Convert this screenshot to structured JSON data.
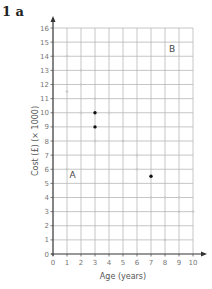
{
  "question_label": "1  a",
  "chart_data": {
    "type": "scatter",
    "title": "",
    "xlabel": "Age (years)",
    "ylabel": "Cost (£) (× 1000)",
    "xlim": [
      0,
      10
    ],
    "ylim": [
      0,
      16
    ],
    "x_ticks": [
      0,
      1,
      2,
      3,
      4,
      5,
      6,
      7,
      8,
      9,
      10
    ],
    "y_ticks": [
      0,
      1,
      2,
      3,
      4,
      5,
      6,
      7,
      8,
      9,
      10,
      11,
      12,
      13,
      14,
      15,
      16
    ],
    "grid": true,
    "series": [
      {
        "name": "faint points",
        "color": "#c8c8c8",
        "points": [
          [
            1,
            14
          ],
          [
            2,
            13
          ],
          [
            2,
            12
          ],
          [
            1,
            11.5
          ],
          [
            3,
            11
          ],
          [
            2,
            10
          ],
          [
            4,
            10
          ],
          [
            3,
            8
          ],
          [
            5,
            8
          ],
          [
            6,
            7
          ],
          [
            6,
            6
          ],
          [
            1,
            6
          ],
          [
            7,
            4
          ],
          [
            8,
            4
          ],
          [
            9,
            4
          ],
          [
            9,
            3
          ],
          [
            10,
            3
          ],
          [
            8,
            1
          ]
        ]
      },
      {
        "name": "highlighted points",
        "color": "#111111",
        "points": [
          [
            3,
            10
          ],
          [
            3,
            9
          ],
          [
            7,
            5.5
          ]
        ]
      }
    ],
    "annotations": [
      {
        "text": "A",
        "x": 1.4,
        "y": 5.6
      },
      {
        "text": "B",
        "x": 8.5,
        "y": 14.5
      }
    ]
  }
}
